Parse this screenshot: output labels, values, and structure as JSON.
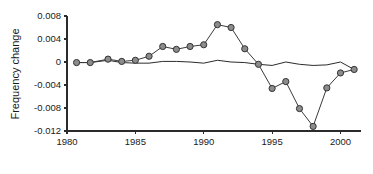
{
  "chart_data": {
    "type": "line",
    "title": "",
    "subtitle": "",
    "xlabel": "",
    "ylabel": "Frequency change",
    "xlim": [
      1980,
      2001.5
    ],
    "ylim": [
      -0.012,
      0.008
    ],
    "grid": false,
    "legend": null,
    "x_ticks": [
      1980,
      1985,
      1990,
      1995,
      2000
    ],
    "x_tick_labels": [
      "1980",
      "1985",
      "1990",
      "1995",
      "2000"
    ],
    "y_ticks": [
      0.008,
      0.004,
      0,
      -0.004,
      -0.008,
      -0.012
    ],
    "y_tick_labels": [
      "0.008",
      "0.004",
      "0",
      "-0.004",
      "-0.008",
      "-0.012"
    ],
    "series": [
      {
        "name": "marked-series",
        "marker": "circle",
        "marker_fill": "#8c8c8c",
        "marker_edge": "#333333",
        "line_color": "#3a3a3a",
        "x": [
          1980.7,
          1981.7,
          1983,
          1984,
          1985,
          1986,
          1987,
          1988,
          1989,
          1990,
          1991,
          1992,
          1993,
          1994,
          1995,
          1996,
          1997,
          1998,
          1999,
          2000,
          2001
        ],
        "values": [
          -0.0001,
          -0.0001,
          0.0005,
          0.0001,
          0.0003,
          0.001,
          0.0027,
          0.0022,
          0.0027,
          0.003,
          0.0065,
          0.006,
          0.0023,
          -0.0004,
          -0.0046,
          -0.0034,
          -0.0081,
          -0.0112,
          -0.0045,
          -0.0019,
          -0.0013
        ]
      },
      {
        "name": "plain-series",
        "marker": "none",
        "line_color": "#2b2b2b",
        "x": [
          1980.7,
          1981.7,
          1983,
          1984,
          1985,
          1986,
          1987,
          1988,
          1989,
          1990,
          1991,
          1992,
          1993,
          1994,
          1995,
          1996,
          1997,
          1998,
          1999,
          2000,
          2001
        ],
        "values": [
          -0.0001,
          -0.0001,
          0.0003,
          -0.0001,
          -0.0002,
          -0.0002,
          0.0001,
          0.0001,
          0.0,
          -0.0002,
          0.0003,
          0.0,
          -0.0001,
          -0.0004,
          -0.0006,
          0.0,
          -0.0004,
          -0.0006,
          -0.0005,
          0.0,
          -0.0013
        ]
      }
    ]
  }
}
